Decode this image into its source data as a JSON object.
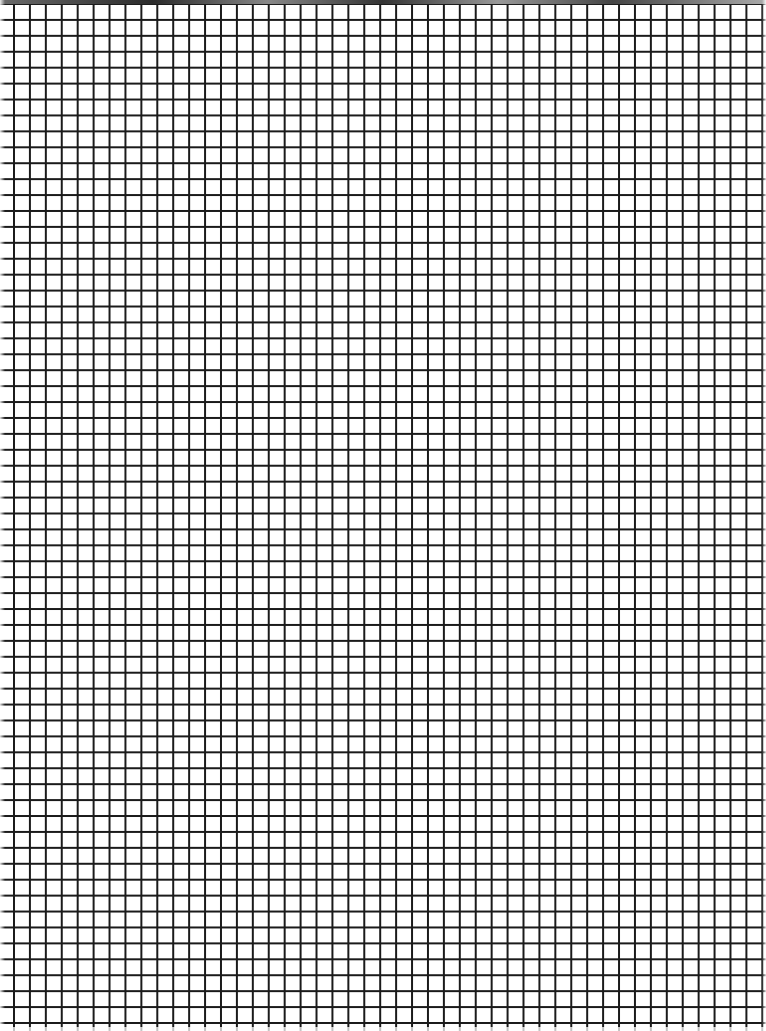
{
  "page": {
    "type": "grid-paper",
    "width": 766,
    "height": 1031
  },
  "grid": {
    "cell_size_px": 16,
    "line_color": "#1a1a1a",
    "background_color": "#ffffff",
    "columns": 47,
    "rows": 64
  }
}
